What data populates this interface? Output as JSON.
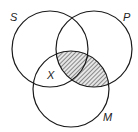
{
  "diagram": {
    "type": "venn",
    "sets": [
      {
        "id": "S",
        "label": "S",
        "cx": 50,
        "cy": 49,
        "r": 38,
        "label_x": 10,
        "label_y": 21
      },
      {
        "id": "P",
        "label": "P",
        "cx": 94,
        "cy": 49,
        "r": 38,
        "label_x": 123,
        "label_y": 21
      },
      {
        "id": "M",
        "label": "M",
        "cx": 71,
        "cy": 89,
        "r": 38,
        "label_x": 103,
        "label_y": 121
      }
    ],
    "shaded_region": "P ∩ M",
    "marker": {
      "label": "X",
      "region": "S ∩ M outside P",
      "x": 47,
      "y": 78
    },
    "colors": {
      "stroke": "#1a1a1a",
      "hatch": "#555555",
      "background": "#ffffff"
    }
  }
}
